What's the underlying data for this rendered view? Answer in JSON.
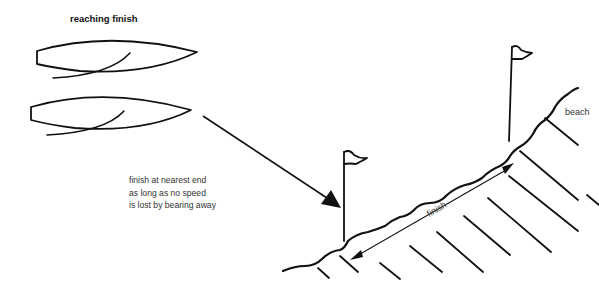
{
  "diagram": {
    "title": "reaching finish",
    "note_lines": [
      "finish at nearest end",
      "as long as no speed",
      "is lost by bearing away"
    ],
    "labels": {
      "beach": "beach",
      "finish": "finish"
    },
    "elements": {
      "boats": [
        "boat-upper",
        "boat-lower"
      ],
      "flags": [
        "finish-flag-near",
        "finish-flag-far"
      ],
      "arrows": [
        "course-arrow",
        "finish-line-double-arrow"
      ],
      "shore": "shoreline"
    },
    "colors": {
      "ink": "#111111",
      "background": "#ffffff"
    }
  }
}
